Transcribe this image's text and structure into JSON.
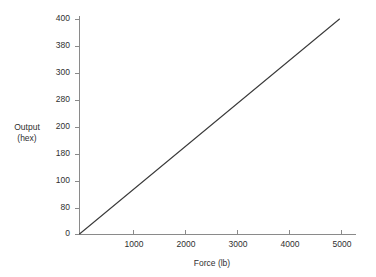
{
  "chart_data": {
    "type": "line",
    "title": "",
    "xlabel": "Force (lb)",
    "ylabel_line1": "Output",
    "ylabel_line2": "(hex)",
    "ylabel": "Output (hex)",
    "x": [
      0,
      5000
    ],
    "values": [
      0,
      1024
    ],
    "series": [
      {
        "name": "Output (hex) vs Force (lb)",
        "x": [
          0,
          1000,
          2000,
          3000,
          4000,
          5000
        ],
        "values": [
          0,
          205,
          410,
          614,
          819,
          1024
        ],
        "labels_hex": [
          "0",
          "CD",
          "19A",
          "266",
          "333",
          "400"
        ]
      }
    ],
    "xlim": [
      0,
      5400
    ],
    "ylim": [
      0,
      1024
    ],
    "xticks": [
      0,
      1000,
      2000,
      3000,
      4000,
      5000
    ],
    "xticklabels": [
      "",
      "1000",
      "2000",
      "3000",
      "4000",
      "5000"
    ],
    "yticks": [
      0,
      128,
      256,
      384,
      512,
      640,
      768,
      896,
      1024
    ],
    "yticklabels": [
      "0",
      "80",
      "100",
      "180",
      "200",
      "280",
      "300",
      "380",
      "400"
    ],
    "ytick_notes": "y-axis values are hexadecimal, stepping by 0x80",
    "grid": false,
    "legend": false,
    "line_color": "#3a3a3a",
    "axis_color": "#8a8a8a",
    "text_color": "#2f2f2f",
    "background_color": "#ffffff"
  },
  "axes": {
    "y_ticks": [
      {
        "label": "400",
        "y": 19
      },
      {
        "label": "380",
        "y": 46
      },
      {
        "label": "300",
        "y": 73
      },
      {
        "label": "280",
        "y": 100
      },
      {
        "label": "200",
        "y": 127
      },
      {
        "label": "180",
        "y": 154
      },
      {
        "label": "100",
        "y": 181
      },
      {
        "label": "80",
        "y": 208
      },
      {
        "label": "0",
        "y": 234
      }
    ],
    "x_ticks": [
      {
        "label": "1000",
        "x": 133
      },
      {
        "label": "2000",
        "x": 185
      },
      {
        "label": "3000",
        "x": 237
      },
      {
        "label": "4000",
        "x": 289
      },
      {
        "label": "5000",
        "x": 341
      }
    ]
  }
}
